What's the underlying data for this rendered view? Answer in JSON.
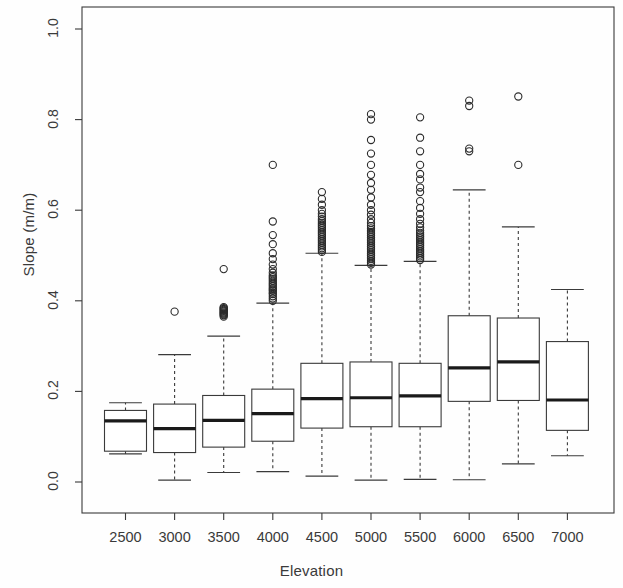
{
  "chart_data": {
    "type": "boxplot",
    "title": "",
    "xlabel": "Elevation",
    "ylabel": "Slope (m/m)",
    "xlim": [
      2250,
      7250
    ],
    "ylim": [
      -0.03,
      1.06
    ],
    "grid": false,
    "legend": "none",
    "y_ticks": [
      "0.0",
      "0.2",
      "0.4",
      "0.6",
      "0.8",
      "1.0"
    ],
    "y_tick_values": [
      0.0,
      0.2,
      0.4,
      0.6,
      0.8,
      1.0
    ],
    "categories": [
      "2500",
      "3000",
      "3500",
      "4000",
      "4500",
      "5000",
      "5500",
      "6000",
      "6500",
      "7000"
    ],
    "boxes": [
      {
        "category": "2500",
        "whisker_low": 0.062,
        "q1": 0.068,
        "median": 0.135,
        "q3": 0.158,
        "whisker_high": 0.175,
        "outliers": []
      },
      {
        "category": "3000",
        "whisker_low": 0.004,
        "q1": 0.065,
        "median": 0.118,
        "q3": 0.172,
        "whisker_high": 0.281,
        "outliers": [
          0.376
        ]
      },
      {
        "category": "3500",
        "whisker_low": 0.021,
        "q1": 0.077,
        "median": 0.136,
        "q3": 0.191,
        "whisker_high": 0.322,
        "outliers": [
          0.365,
          0.368,
          0.37,
          0.372,
          0.374,
          0.376,
          0.378,
          0.38,
          0.382,
          0.384,
          0.386,
          0.47
        ]
      },
      {
        "category": "4000",
        "whisker_low": 0.023,
        "q1": 0.09,
        "median": 0.151,
        "q3": 0.205,
        "whisker_high": 0.395,
        "outliers": [
          0.4,
          0.405,
          0.41,
          0.415,
          0.418,
          0.422,
          0.425,
          0.428,
          0.432,
          0.436,
          0.44,
          0.444,
          0.448,
          0.452,
          0.456,
          0.462,
          0.47,
          0.48,
          0.492,
          0.505,
          0.525,
          0.545,
          0.575,
          0.7
        ]
      },
      {
        "category": "4500",
        "whisker_low": 0.013,
        "q1": 0.119,
        "median": 0.184,
        "q3": 0.262,
        "whisker_high": 0.505,
        "outliers": [
          0.508,
          0.512,
          0.516,
          0.52,
          0.524,
          0.528,
          0.532,
          0.536,
          0.54,
          0.544,
          0.548,
          0.552,
          0.556,
          0.56,
          0.564,
          0.568,
          0.572,
          0.576,
          0.58,
          0.586,
          0.592,
          0.6,
          0.612,
          0.625,
          0.64
        ]
      },
      {
        "category": "5000",
        "whisker_low": 0.004,
        "q1": 0.122,
        "median": 0.186,
        "q3": 0.265,
        "whisker_high": 0.478,
        "outliers": [
          0.48,
          0.484,
          0.488,
          0.492,
          0.496,
          0.5,
          0.504,
          0.508,
          0.512,
          0.516,
          0.52,
          0.524,
          0.528,
          0.532,
          0.536,
          0.54,
          0.544,
          0.548,
          0.552,
          0.556,
          0.56,
          0.565,
          0.572,
          0.58,
          0.59,
          0.6,
          0.612,
          0.628,
          0.645,
          0.66,
          0.678,
          0.7,
          0.725,
          0.755,
          0.8,
          0.812
        ]
      },
      {
        "category": "5500",
        "whisker_low": 0.006,
        "q1": 0.122,
        "median": 0.19,
        "q3": 0.262,
        "whisker_high": 0.487,
        "outliers": [
          0.49,
          0.494,
          0.498,
          0.502,
          0.506,
          0.51,
          0.514,
          0.518,
          0.522,
          0.526,
          0.53,
          0.534,
          0.538,
          0.542,
          0.546,
          0.55,
          0.555,
          0.562,
          0.57,
          0.58,
          0.592,
          0.605,
          0.62,
          0.64,
          0.65,
          0.668,
          0.68,
          0.7,
          0.73,
          0.76,
          0.805
        ]
      },
      {
        "category": "6000",
        "whisker_low": 0.005,
        "q1": 0.178,
        "median": 0.252,
        "q3": 0.367,
        "whisker_high": 0.645,
        "outliers": [
          0.73,
          0.736,
          0.83,
          0.842
        ]
      },
      {
        "category": "6500",
        "whisker_low": 0.04,
        "q1": 0.18,
        "median": 0.265,
        "q3": 0.362,
        "whisker_high": 0.563,
        "outliers": [
          0.7,
          0.851
        ]
      },
      {
        "category": "7000",
        "whisker_low": 0.058,
        "q1": 0.114,
        "median": 0.181,
        "q3": 0.31,
        "whisker_high": 0.425,
        "outliers": []
      }
    ]
  },
  "axis": {
    "ylabel": "Slope (m/m)",
    "xlabel": "Elevation"
  },
  "style": {
    "line_color": "#3a3a3a",
    "median_color": "#1a1a1a",
    "background": "#ffffff"
  }
}
